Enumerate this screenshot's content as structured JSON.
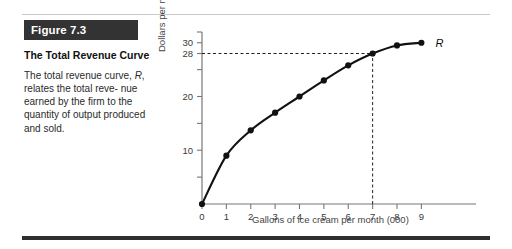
{
  "figure": {
    "badge": "Figure 7.3",
    "title": "The Total Revenue Curve",
    "body_line1": "The total revenue curve,",
    "body_italic": "R",
    "body_line2": ", relates the total reve-",
    "body_line3": "nue earned by the firm to",
    "body_line4": "the quantity of output",
    "body_line5": "produced and sold."
  },
  "chart_data": {
    "type": "line",
    "title": "The Total Revenue Curve",
    "xlabel": "Gallons of ice cream per month (000)",
    "ylabel": "Dollars per month (000)",
    "xlim": [
      0,
      9.6
    ],
    "ylim": [
      0,
      32
    ],
    "grid": false,
    "legend": "none",
    "series_label": "R",
    "x": [
      0,
      1,
      2,
      3,
      4,
      5,
      6,
      7,
      8,
      9
    ],
    "values": [
      0,
      9,
      13.7,
      17,
      20,
      23,
      25.8,
      28,
      29.5,
      30
    ],
    "x_ticks": [
      "0",
      "1",
      "2",
      "3",
      "4",
      "5",
      "6",
      "7",
      "8",
      "9"
    ],
    "y_ticks_labeled": [
      "10",
      "20",
      "28",
      "30"
    ],
    "y_tick_values": [
      10,
      20,
      28,
      30
    ],
    "y_minor_ticks": [
      5,
      15,
      25,
      32
    ],
    "annotation": {
      "label": "R",
      "reference_x": 7,
      "reference_y": 28,
      "dashed_guides": true
    },
    "marker": "filled-circle",
    "line_color": "#111111"
  }
}
